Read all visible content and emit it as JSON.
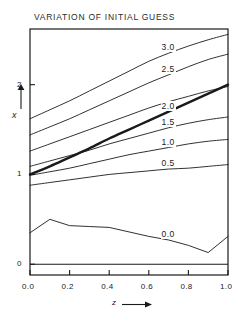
{
  "chart_data": {
    "type": "line",
    "title": "VARIATION OF INITIAL GUESS",
    "xlabel": "z",
    "ylabel": "x",
    "xlim": [
      0.0,
      1.0
    ],
    "ylim": [
      -0.12,
      2.62
    ],
    "grid": false,
    "legend": "inline-curve-labels",
    "x_ticks": [
      0.0,
      0.2,
      0.4,
      0.6,
      0.8,
      1.0
    ],
    "x_tick_labels": [
      "0.0",
      "0.2",
      "0.4",
      "0.6",
      "0.8",
      "1.0"
    ],
    "y_ticks": [
      0,
      1,
      2
    ],
    "y_tick_labels": [
      "0",
      "1",
      "2"
    ],
    "x": [
      0.0,
      0.1,
      0.2,
      0.3,
      0.4,
      0.5,
      0.6,
      0.7,
      0.8,
      0.9,
      1.0
    ],
    "series": [
      {
        "name": "3.0",
        "label": "3.0",
        "label_x": 0.66,
        "values": [
          1.62,
          1.72,
          1.82,
          1.93,
          2.04,
          2.15,
          2.26,
          2.35,
          2.43,
          2.5,
          2.56
        ],
        "linewidth": "thin"
      },
      {
        "name": "2.5",
        "label": "2.5",
        "label_x": 0.66,
        "values": [
          1.44,
          1.53,
          1.62,
          1.72,
          1.82,
          1.92,
          2.02,
          2.11,
          2.2,
          2.28,
          2.34
        ],
        "linewidth": "thin"
      },
      {
        "name": "2.0",
        "label": "2.0",
        "label_x": 0.68,
        "values": [
          1.0,
          1.09,
          1.19,
          1.29,
          1.4,
          1.5,
          1.6,
          1.7,
          1.8,
          1.9,
          2.0
        ],
        "linewidth": "thick"
      },
      {
        "name": "2.0-alt",
        "label": "",
        "label_x": null,
        "values": [
          1.26,
          1.34,
          1.42,
          1.5,
          1.58,
          1.66,
          1.74,
          1.81,
          1.87,
          1.93,
          1.98
        ],
        "linewidth": "thin"
      },
      {
        "name": "1.5",
        "label": "1.5",
        "label_x": 0.66,
        "values": [
          1.09,
          1.15,
          1.21,
          1.27,
          1.34,
          1.4,
          1.46,
          1.52,
          1.57,
          1.61,
          1.64
        ],
        "linewidth": "thin"
      },
      {
        "name": "1.0",
        "label": "1.0",
        "label_x": 0.68,
        "values": [
          0.99,
          1.03,
          1.07,
          1.12,
          1.17,
          1.22,
          1.26,
          1.3,
          1.34,
          1.37,
          1.39
        ],
        "linewidth": "thin"
      },
      {
        "name": "0.5",
        "label": "0.5",
        "label_x": 0.68,
        "values": [
          0.88,
          0.91,
          0.94,
          0.97,
          1.0,
          1.02,
          1.04,
          1.06,
          1.07,
          1.09,
          1.11
        ],
        "linewidth": "thin"
      },
      {
        "name": "0.0",
        "label": "0.0",
        "label_x": 0.68,
        "values": [
          0.35,
          0.5,
          0.43,
          0.42,
          0.41,
          0.36,
          0.31,
          0.27,
          0.21,
          0.13,
          0.31
        ],
        "linewidth": "thin"
      }
    ],
    "zero_line": 0
  },
  "axes": {
    "y_arrow_name": "y-axis-arrow",
    "x_arrow_name": "x-axis-arrow"
  }
}
